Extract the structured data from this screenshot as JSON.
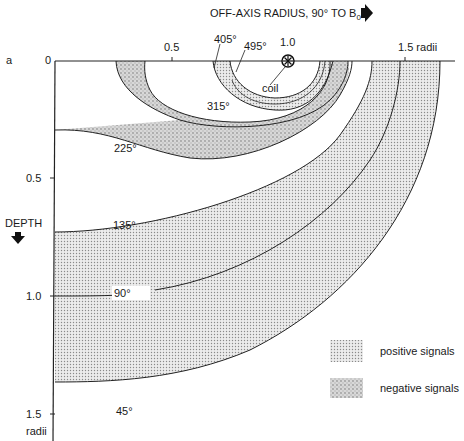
{
  "figure": {
    "panel_label": "a",
    "x_axis": {
      "title": "OFF-AXIS RADIUS, 90° TO B",
      "title_subscript": "0",
      "ticks": [
        "0",
        "0.5",
        "1.0",
        "1.5 radii"
      ],
      "arrow": "right-arrow-icon"
    },
    "y_axis": {
      "title": "DEPTH",
      "ticks": [
        "0.5",
        "1.0",
        "1.5"
      ],
      "unit": "radii",
      "arrow": "down-arrow-icon"
    },
    "coil_label": "coil",
    "contours": [
      {
        "label": "405°"
      },
      {
        "label": "495°"
      },
      {
        "label": "315°"
      },
      {
        "label": "225°"
      },
      {
        "label": "135°"
      },
      {
        "label": "90°"
      },
      {
        "label": "45°"
      }
    ],
    "legend": [
      {
        "label": "positive signals",
        "swatch": "fine-dot-stipple",
        "color": "#d9d9d9"
      },
      {
        "label": "negative signals",
        "swatch": "coarse-gray-stipple",
        "color": "#bdbdbd"
      }
    ]
  }
}
